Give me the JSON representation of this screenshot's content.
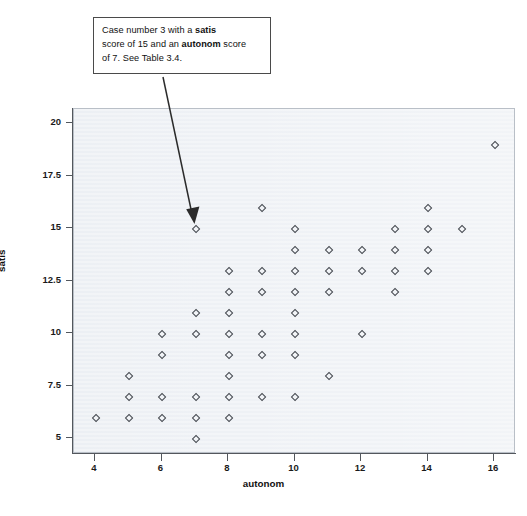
{
  "annotation": {
    "line1_a": "Case number 3 with a ",
    "line1_bold": "satis",
    "line2_a": "score of 15 and an ",
    "line2_bold": "autonom",
    "line2_b": " score",
    "line3": "of 7. See Table 3.4.",
    "full_text": "Case number 3 with a satis score of 15 and an autonom score of 7. See Table 3.4.",
    "arrow_icon": "arrow-pointer-icon",
    "points_to": {
      "autonom": 7,
      "satis": 15
    }
  },
  "axes": {
    "x_title": "autonom",
    "y_title": "satis",
    "x_ticks": [
      "4",
      "6",
      "8",
      "10",
      "12",
      "14",
      "16"
    ],
    "y_ticks": [
      "5",
      "7.5",
      "10",
      "12.5",
      "15",
      "17.5",
      "20"
    ]
  },
  "colors": {
    "panel_background": "#eef1f5",
    "panel_border": "#b9bfc7",
    "marker": "#44484f",
    "axis": "#53575d",
    "annotation_border": "#4a4a4a",
    "text": "#111111"
  },
  "chart_data": {
    "type": "scatter",
    "title": "",
    "xlabel": "autonom",
    "ylabel": "satis",
    "xlim": [
      3.4,
      16.6
    ],
    "ylim": [
      4.2,
      20.8
    ],
    "xticks": [
      4,
      6,
      8,
      10,
      12,
      14,
      16
    ],
    "yticks": [
      5,
      7.5,
      10,
      12.5,
      15,
      17.5,
      20
    ],
    "grid": false,
    "legend": "none",
    "marker": "open-diamond",
    "annotations": [
      {
        "text": "Case number 3 with a satis score of 15 and an autonom score of 7. See Table 3.4.",
        "target_x": 7,
        "target_y": 15
      }
    ],
    "points": [
      [
        4,
        6
      ],
      [
        5,
        8
      ],
      [
        5,
        7
      ],
      [
        5,
        6
      ],
      [
        6,
        10
      ],
      [
        6,
        9
      ],
      [
        6,
        7
      ],
      [
        6,
        6
      ],
      [
        7,
        15
      ],
      [
        7,
        11
      ],
      [
        7,
        10
      ],
      [
        7,
        7
      ],
      [
        7,
        6
      ],
      [
        7,
        5
      ],
      [
        8,
        13
      ],
      [
        8,
        12
      ],
      [
        8,
        11
      ],
      [
        8,
        10
      ],
      [
        8,
        9
      ],
      [
        8,
        8
      ],
      [
        8,
        7
      ],
      [
        8,
        6
      ],
      [
        9,
        16
      ],
      [
        9,
        13
      ],
      [
        9,
        12
      ],
      [
        9,
        10
      ],
      [
        9,
        9
      ],
      [
        9,
        7
      ],
      [
        10,
        15
      ],
      [
        10,
        14
      ],
      [
        10,
        13
      ],
      [
        10,
        12
      ],
      [
        10,
        11
      ],
      [
        10,
        10
      ],
      [
        10,
        9
      ],
      [
        10,
        7
      ],
      [
        11,
        14
      ],
      [
        11,
        13
      ],
      [
        11,
        12
      ],
      [
        11,
        8
      ],
      [
        12,
        14
      ],
      [
        12,
        13
      ],
      [
        12,
        10
      ],
      [
        13,
        15
      ],
      [
        13,
        14
      ],
      [
        13,
        13
      ],
      [
        13,
        12
      ],
      [
        14,
        16
      ],
      [
        14,
        15
      ],
      [
        14,
        14
      ],
      [
        14,
        13
      ],
      [
        15,
        15
      ],
      [
        16,
        19
      ]
    ]
  }
}
